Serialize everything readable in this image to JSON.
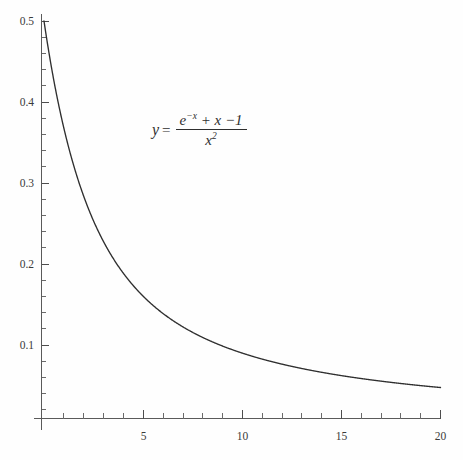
{
  "chart_data": {
    "type": "line",
    "title": "",
    "subtitle": "",
    "xlabel": "",
    "ylabel": "",
    "xlim": [
      0,
      20
    ],
    "ylim": [
      0,
      0.5
    ],
    "grid": false,
    "legend_position": "none",
    "x_ticks_major": [
      5,
      10,
      15,
      20
    ],
    "x_tick_labels": [
      "5",
      "10",
      "15",
      "20"
    ],
    "x_tick_minor_step": 1,
    "y_ticks_major": [
      0.1,
      0.2,
      0.3,
      0.4,
      0.5
    ],
    "y_tick_labels": [
      "0.1",
      "0.2",
      "0.3",
      "0.4",
      "0.5"
    ],
    "y_tick_minor_step": 0.02,
    "annotations": [
      {
        "name": "equation",
        "text": "y = (e^-x + x - 1) / x^2",
        "lhs": "y",
        "equals": "=",
        "numerator": "e^-x + x -1",
        "denominator": "x^2",
        "x_data": 7.2,
        "y_data": 0.355
      }
    ],
    "series": [
      {
        "name": "y = (e^-x + x - 1)/x^2",
        "color": "#2f2f2f",
        "x": [
          0.0,
          0.25,
          0.5,
          0.75,
          1.0,
          1.25,
          1.5,
          1.75,
          2.0,
          2.25,
          2.5,
          2.75,
          3.0,
          3.25,
          3.5,
          3.75,
          4.0,
          4.25,
          4.5,
          4.75,
          5.0,
          5.5,
          6.0,
          6.5,
          7.0,
          7.5,
          8.0,
          8.5,
          9.0,
          9.5,
          10.0,
          11.0,
          12.0,
          13.0,
          14.0,
          15.0,
          16.0,
          17.0,
          18.0,
          19.0,
          20.0
        ],
        "y": [
          0.5,
          0.4427,
          0.3935,
          0.3511,
          0.3679,
          0.3291,
          0.303,
          0.2828,
          0.2838,
          0.2639,
          0.2468,
          0.2323,
          0.2345,
          0.2207,
          0.2086,
          0.198,
          0.2011,
          0.1905,
          0.1813,
          0.173,
          0.1627,
          0.1637,
          0.1597,
          0.1465,
          0.1432,
          0.1374,
          0.1253,
          0.1234,
          0.1112,
          0.1067,
          0.1,
          0.0909,
          0.0833,
          0.0769,
          0.0714,
          0.0667,
          0.0625,
          0.0588,
          0.0556,
          0.0526,
          0.05
        ]
      }
    ],
    "formula": "y = (exp(-x) + x - 1) / x^2",
    "curve_endpoints": {
      "start": [
        0,
        0.5
      ],
      "end": [
        20,
        0.05
      ]
    }
  },
  "axes": {
    "x_axis_name": "x-axis",
    "y_axis_name": "y-axis",
    "background_color": "#fefefe",
    "axis_color": "#5a5a5a",
    "curve_color": "#2f2f2f",
    "text_color": "#3a3a3a"
  },
  "equation": {
    "lhs": "y",
    "equals": "=",
    "numer_e": "e",
    "numer_e_exp": "−x",
    "numer_rest": "+ x −1",
    "denom_x": "x",
    "denom_exp": "2"
  }
}
